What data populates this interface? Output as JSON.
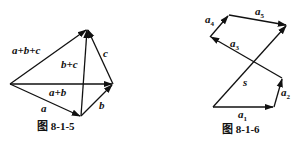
{
  "figures": [
    {
      "caption": "图 8-1-5",
      "labels": {
        "abc": "a+b+c",
        "bc": "b+c",
        "c": "c",
        "ab": "a+b",
        "a": "a",
        "b": "b"
      }
    },
    {
      "caption": "图 8-1-6",
      "labels": {
        "a1": "a",
        "a1_sub": "1",
        "a2": "a",
        "a2_sub": "2",
        "a3": "a",
        "a3_sub": "3",
        "a4": "a",
        "a4_sub": "4",
        "a5": "a",
        "a5_sub": "5",
        "s": "s"
      }
    }
  ],
  "colors": {
    "stroke": "#111111",
    "background": "#ffffff"
  }
}
